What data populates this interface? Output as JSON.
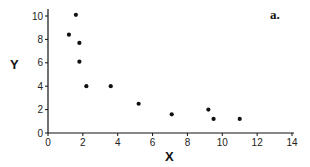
{
  "chart_data": {
    "type": "scatter",
    "title": "",
    "panel_label": "a.",
    "xlabel": "X",
    "ylabel": "Y",
    "xlim": [
      0,
      14
    ],
    "ylim": [
      0,
      10.5
    ],
    "xticks": [
      0,
      2,
      4,
      6,
      8,
      10,
      12,
      14
    ],
    "yticks": [
      0,
      2,
      4,
      6,
      8,
      10
    ],
    "grid": false,
    "legend": null,
    "series": [
      {
        "name": "data",
        "color": "#111111",
        "points": [
          {
            "x": 1.6,
            "y": 10.1
          },
          {
            "x": 1.2,
            "y": 8.4
          },
          {
            "x": 1.8,
            "y": 7.7
          },
          {
            "x": 1.8,
            "y": 6.1
          },
          {
            "x": 2.2,
            "y": 4.0
          },
          {
            "x": 3.6,
            "y": 4.0
          },
          {
            "x": 5.2,
            "y": 2.5
          },
          {
            "x": 7.1,
            "y": 1.6
          },
          {
            "x": 9.2,
            "y": 2.0
          },
          {
            "x": 9.5,
            "y": 1.2
          },
          {
            "x": 11.0,
            "y": 1.2
          }
        ]
      }
    ]
  }
}
